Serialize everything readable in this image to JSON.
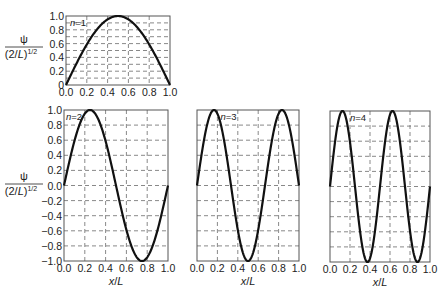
{
  "chart_data": [
    {
      "type": "line",
      "id": "n1",
      "annotation": "n=1",
      "function": "sin(1*pi*x)",
      "x": [
        0.0,
        0.1,
        0.2,
        0.3,
        0.4,
        0.5,
        0.6,
        0.7,
        0.8,
        0.9,
        1.0
      ],
      "y": [
        0.0,
        0.309,
        0.588,
        0.809,
        0.951,
        1.0,
        0.951,
        0.809,
        0.588,
        0.309,
        0.0
      ],
      "xlabel": "",
      "ylabel": "ψ / (2/L)^1/2",
      "xlim": [
        0.0,
        1.0
      ],
      "ylim": [
        0.0,
        1.0
      ],
      "xticks": [
        "0.0",
        "0.2",
        "0.4",
        "0.6",
        "0.8",
        "1.0"
      ],
      "yticks": [
        "0",
        "0.2",
        "0.4",
        "0.6",
        "0.8",
        "1.0"
      ],
      "grid": "dashed; horizontal every 0.1, vertical every 0.2",
      "frame": {
        "left": 66,
        "top": 16,
        "right": 170,
        "bottom": 85
      },
      "hgrid_step": 0.1
    },
    {
      "type": "line",
      "id": "n2",
      "annotation": "n=2",
      "function": "sin(2*pi*x)",
      "x": [
        0.0,
        0.125,
        0.25,
        0.375,
        0.5,
        0.625,
        0.75,
        0.875,
        1.0
      ],
      "y": [
        0.0,
        0.707,
        1.0,
        0.707,
        0.0,
        -0.707,
        -1.0,
        -0.707,
        0.0
      ],
      "xlabel": "x/L",
      "ylabel": "ψ / (2/L)^1/2",
      "xlim": [
        0.0,
        1.0
      ],
      "ylim": [
        -1.0,
        1.0
      ],
      "xticks": [
        "0.0",
        "0.2",
        "0.4",
        "0.6",
        "0.8",
        "1.0"
      ],
      "yticks": [
        "1.0",
        "0.8",
        "0.6",
        "0.4",
        "0.2",
        "0.0",
        "-0.2",
        "-0.4",
        "-0.6",
        "-0.8",
        "-1.0"
      ],
      "grid": "dashed; horizontal every 0.2, vertical every 0.2",
      "frame": {
        "left": 64,
        "top": 110,
        "right": 168,
        "bottom": 261
      },
      "hgrid_step": 0.2
    },
    {
      "type": "line",
      "id": "n3",
      "annotation": "n=3",
      "function": "sin(3*pi*x)",
      "x": [
        0.0,
        0.1667,
        0.3333,
        0.5,
        0.6667,
        0.8333,
        1.0
      ],
      "y": [
        0.0,
        1.0,
        0.0,
        -1.0,
        0.0,
        1.0,
        0.0
      ],
      "xlabel": "x/L",
      "ylabel": "",
      "xlim": [
        0.0,
        1.0
      ],
      "ylim": [
        -1.0,
        1.0
      ],
      "xticks": [
        "0.0",
        "0.2",
        "0.4",
        "0.6",
        "0.8",
        "1.0"
      ],
      "yticks": [],
      "grid": "dashed; horizontal every 0.2, vertical every 0.2",
      "frame": {
        "left": 197,
        "top": 110,
        "right": 299,
        "bottom": 261
      },
      "hgrid_step": 0.2
    },
    {
      "type": "line",
      "id": "n4",
      "annotation": "n=4",
      "function": "sin(4*pi*x)",
      "x": [
        0.0,
        0.125,
        0.25,
        0.375,
        0.5,
        0.625,
        0.75,
        0.875,
        1.0
      ],
      "y": [
        0.0,
        1.0,
        0.0,
        -1.0,
        0.0,
        1.0,
        0.0,
        -1.0,
        0.0
      ],
      "xlabel": "x/L",
      "ylabel": "",
      "xlim": [
        0.0,
        1.0
      ],
      "ylim": [
        -1.0,
        1.0
      ],
      "xticks": [
        "0.0",
        "0.2",
        "0.4",
        "0.6",
        "0.8",
        "1.0"
      ],
      "yticks": [],
      "grid": "dashed; horizontal every 0.2, vertical every 0.2",
      "frame": {
        "left": 330,
        "top": 111,
        "right": 430,
        "bottom": 262
      },
      "hgrid_step": 0.2
    }
  ],
  "ylabel_parts": {
    "numerator": "ψ",
    "denominator": "(2/L)",
    "exponent": "1/2"
  },
  "xlabel_parts": {
    "var": "x",
    "sep": "/",
    "L": "L"
  },
  "colors": {
    "curve": "#111111",
    "frame": "#555555",
    "grid": "#6a6a6a",
    "text": "#222222"
  }
}
